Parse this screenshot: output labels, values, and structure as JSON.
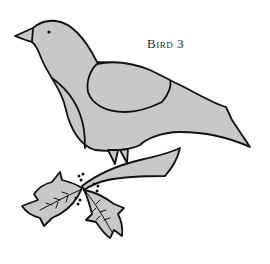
{
  "figure": {
    "title": "Bird 3",
    "colors": {
      "fill": "#c8c8c8",
      "stroke": "#111111",
      "background": "#ffffff"
    }
  }
}
